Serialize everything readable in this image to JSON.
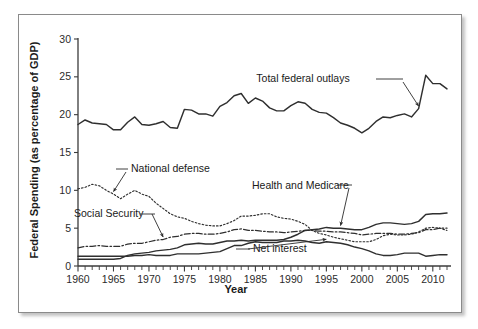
{
  "figure": {
    "y_axis_title": "Federal Spending (as percentage of GDP)",
    "x_axis_title": "Year"
  },
  "chart_data": {
    "type": "line",
    "title": "",
    "xlabel": "Year",
    "ylabel": "Federal Spending (as percentage of GDP)",
    "xlim": [
      1960,
      2012
    ],
    "ylim": [
      0,
      30
    ],
    "grid": false,
    "legend_position": "inline-annotations",
    "x_ticks": [
      1960,
      1965,
      1970,
      1975,
      1980,
      1985,
      1990,
      1995,
      2000,
      2005,
      2010
    ],
    "x_minor_tick_interval": 1,
    "y_ticks": [
      0,
      5,
      10,
      15,
      20,
      25,
      30
    ],
    "x": [
      1960,
      1961,
      1962,
      1963,
      1964,
      1965,
      1966,
      1967,
      1968,
      1969,
      1970,
      1971,
      1972,
      1973,
      1974,
      1975,
      1976,
      1977,
      1978,
      1979,
      1980,
      1981,
      1982,
      1983,
      1984,
      1985,
      1986,
      1987,
      1988,
      1989,
      1990,
      1991,
      1992,
      1993,
      1994,
      1995,
      1996,
      1997,
      1998,
      1999,
      2000,
      2001,
      2002,
      2003,
      2004,
      2005,
      2006,
      2007,
      2008,
      2009,
      2010,
      2011,
      2012
    ],
    "annotations": [
      {
        "label": "Total federal outlays",
        "series": "total_federal_outlays"
      },
      {
        "label": "National defense",
        "series": "national_defense"
      },
      {
        "label": "Social Security",
        "series": "social_security"
      },
      {
        "label": "Health and Medicare",
        "series": "health_and_medicare"
      },
      {
        "label": "Net interest",
        "series": "net_interest"
      }
    ],
    "series": [
      {
        "name": "Total federal outlays",
        "key": "total_federal_outlays",
        "style": "solid",
        "values": [
          18.7,
          19.3,
          18.9,
          18.8,
          18.7,
          18.0,
          18.0,
          19.0,
          19.7,
          18.7,
          18.6,
          18.8,
          19.1,
          18.3,
          18.2,
          20.7,
          20.6,
          20.1,
          20.1,
          19.8,
          21.1,
          21.6,
          22.5,
          22.8,
          21.5,
          22.2,
          21.8,
          20.9,
          20.5,
          20.5,
          21.2,
          21.7,
          21.5,
          20.7,
          20.3,
          20.2,
          19.6,
          18.9,
          18.6,
          18.2,
          17.6,
          18.2,
          19.1,
          19.7,
          19.6,
          19.9,
          20.1,
          19.7,
          20.8,
          25.2,
          24.1,
          24.1,
          23.4
        ]
      },
      {
        "name": "National defense",
        "key": "national_defense",
        "style": "dotted",
        "values": [
          10.2,
          10.4,
          10.8,
          10.6,
          10.0,
          9.5,
          8.9,
          9.5,
          10.0,
          9.5,
          9.2,
          8.3,
          7.6,
          6.9,
          6.5,
          6.3,
          5.9,
          5.6,
          5.4,
          5.3,
          5.3,
          5.6,
          6.0,
          6.6,
          6.6,
          6.7,
          6.9,
          6.9,
          6.5,
          6.3,
          6.2,
          5.9,
          5.5,
          4.7,
          4.3,
          4.1,
          3.8,
          3.6,
          3.4,
          3.2,
          3.2,
          3.2,
          3.5,
          4.0,
          4.2,
          4.1,
          4.1,
          4.2,
          4.5,
          5.0,
          5.1,
          5.0,
          4.7
        ]
      },
      {
        "name": "Social Security",
        "key": "social_security",
        "style": "dash-dot",
        "values": [
          2.4,
          2.6,
          2.6,
          2.7,
          2.6,
          2.6,
          2.6,
          2.9,
          3.0,
          3.0,
          3.2,
          3.4,
          3.5,
          3.8,
          3.9,
          4.2,
          4.3,
          4.3,
          4.2,
          4.2,
          4.3,
          4.5,
          4.8,
          4.9,
          4.7,
          4.7,
          4.6,
          4.5,
          4.5,
          4.4,
          4.5,
          4.6,
          4.7,
          4.7,
          4.6,
          4.6,
          4.5,
          4.5,
          4.4,
          4.3,
          4.1,
          4.2,
          4.3,
          4.3,
          4.3,
          4.2,
          4.2,
          4.3,
          4.4,
          4.8,
          4.8,
          5.0,
          5.0
        ]
      },
      {
        "name": "Health and Medicare",
        "key": "health_and_medicare",
        "style": "solid",
        "values": [
          0.9,
          0.9,
          0.9,
          0.9,
          0.9,
          0.9,
          1.0,
          1.4,
          1.6,
          1.7,
          1.8,
          2.0,
          2.1,
          2.2,
          2.4,
          2.8,
          2.9,
          3.0,
          2.9,
          2.9,
          3.1,
          3.3,
          3.3,
          3.4,
          3.3,
          3.4,
          3.4,
          3.4,
          3.4,
          3.5,
          3.8,
          4.2,
          4.7,
          4.8,
          4.9,
          5.1,
          5.0,
          5.0,
          4.9,
          4.8,
          4.8,
          5.1,
          5.5,
          5.7,
          5.7,
          5.6,
          5.5,
          5.6,
          5.9,
          6.8,
          6.9,
          6.9,
          7.0
        ]
      },
      {
        "name": "Net interest",
        "key": "net_interest",
        "style": "solid",
        "values": [
          1.3,
          1.3,
          1.3,
          1.3,
          1.3,
          1.3,
          1.3,
          1.3,
          1.4,
          1.4,
          1.5,
          1.4,
          1.4,
          1.4,
          1.6,
          1.6,
          1.6,
          1.6,
          1.7,
          1.8,
          1.9,
          2.3,
          2.7,
          2.7,
          3.0,
          3.2,
          3.1,
          3.1,
          3.1,
          3.3,
          3.3,
          3.4,
          3.3,
          3.1,
          3.0,
          3.2,
          3.1,
          3.0,
          2.8,
          2.5,
          2.3,
          2.0,
          1.6,
          1.4,
          1.4,
          1.5,
          1.7,
          1.7,
          1.7,
          1.3,
          1.4,
          1.5,
          1.5
        ]
      }
    ]
  }
}
